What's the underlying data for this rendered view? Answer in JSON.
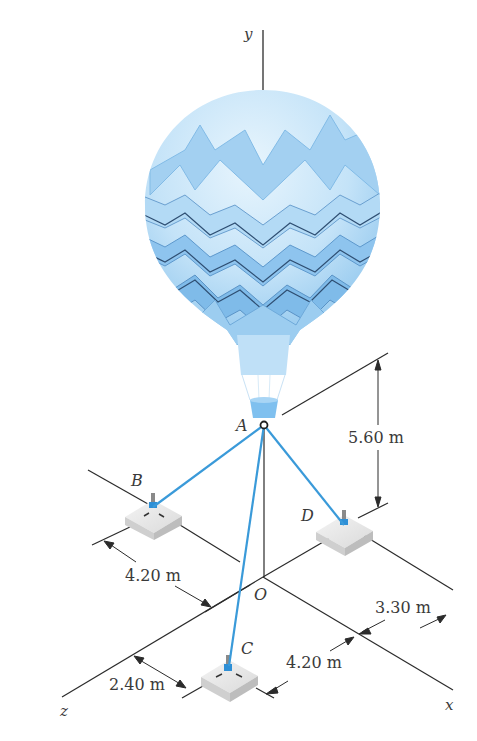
{
  "figure": {
    "axes": {
      "x": "x",
      "y": "y",
      "z": "z",
      "origin": "O"
    },
    "points": {
      "A": "A",
      "B": "B",
      "C": "C",
      "D": "D"
    },
    "dimensions": {
      "height_A": "5.60 m",
      "B_offset_x": "4.20 m",
      "C_offset_z": "2.40 m",
      "C_offset_x": "4.20 m",
      "D_offset_z": "3.30 m"
    },
    "colors": {
      "cable": "#3a9ad9",
      "line": "#2b2b2b",
      "balloon_light": "#d6ecfa",
      "balloon_mid": "#a9d3f2",
      "balloon_dark": "#6fb2e6",
      "anchor_block": "#e4e4e4",
      "anchor_fitting": "#2e8fd6"
    }
  }
}
